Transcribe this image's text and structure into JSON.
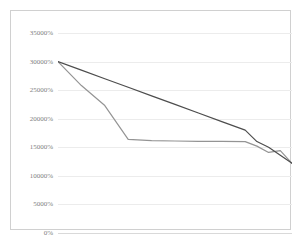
{
  "chart_data": {
    "type": "line",
    "title": "",
    "xlabel": "",
    "ylabel": "",
    "ylim": [
      0,
      35000
    ],
    "grid": true,
    "legend": "none",
    "y_ticks": [
      35000,
      30000,
      25000,
      20000,
      15000,
      10000,
      5000,
      0
    ],
    "y_tick_labels": [
      "35000%",
      "30000%",
      "25000%",
      "20000%",
      "15000%",
      "10000%",
      "5000%",
      "0%"
    ],
    "x": [
      0,
      10,
      20,
      30,
      40,
      50,
      60,
      70,
      80,
      85,
      90,
      95,
      100
    ],
    "series": [
      {
        "name": "series-1",
        "color": "#4d4d4d",
        "values": [
          30000,
          28500,
          27000,
          25500,
          24000,
          22500,
          21000,
          19500,
          18000,
          16000,
          15000,
          13600,
          12200
        ]
      },
      {
        "name": "series-2",
        "color": "#949494",
        "values": [
          30000,
          25800,
          22300,
          16400,
          16150,
          16100,
          16050,
          16050,
          16000,
          15200,
          14100,
          14400,
          12200
        ]
      }
    ]
  },
  "colors": {
    "series_1": "#4d4d4d",
    "series_2": "#949494",
    "gridline": "#ececec",
    "axis": "#d9d9d9",
    "border": "#d0d0d0",
    "tick_text": "#808080",
    "background": "#ffffff"
  }
}
